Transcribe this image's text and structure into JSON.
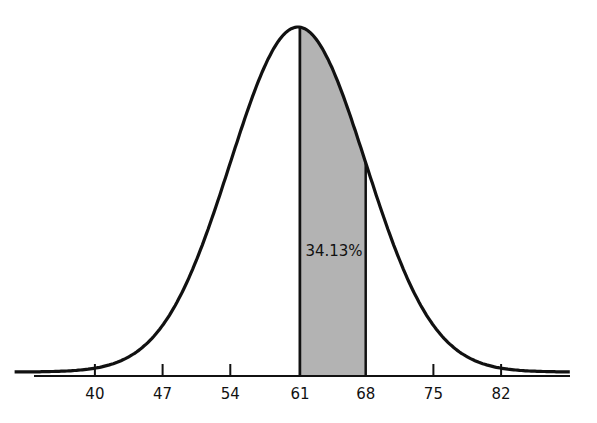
{
  "chart_data": {
    "type": "area",
    "title": "",
    "xlabel": "",
    "ylabel": "",
    "distribution": "normal",
    "mean": 61,
    "sd": 7,
    "categories": [
      "40",
      "47",
      "54",
      "61",
      "68",
      "75",
      "82"
    ],
    "x_ticks": [
      40,
      47,
      54,
      61,
      68,
      75,
      82
    ],
    "shaded_region": {
      "from": 61,
      "to": 68,
      "label": "34.13%",
      "value_percent": 34.13,
      "color": "#b3b3b3"
    },
    "grid": false,
    "legend": null,
    "xlim": [
      32,
      89
    ]
  },
  "labels": {
    "area": "34.13%",
    "ticks": [
      "40",
      "47",
      "54",
      "61",
      "68",
      "75",
      "82"
    ]
  }
}
